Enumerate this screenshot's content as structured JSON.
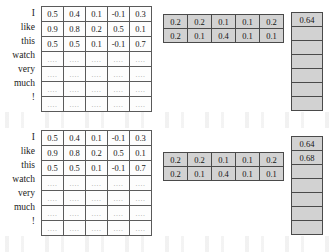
{
  "figure": {
    "colors": {
      "grid_fill": "#d2d2d2",
      "matrix_fill": "#fdfdfd",
      "border_outer": "#3a3a3a",
      "border_inner": "#5a5a5a",
      "text": "#161616",
      "ellipsis": "#9a9a9a",
      "background": "#ffffff"
    },
    "ellipsis_glyph": "...."
  },
  "panels": [
    {
      "id": "panel-top",
      "word_labels": [
        "I",
        "like",
        "this",
        "watch",
        "very",
        "much",
        "!"
      ],
      "embedding_matrix": {
        "rows": 7,
        "cols": 5,
        "values": [
          [
            "0.5",
            "0.4",
            "0.1",
            "-0.1",
            "0.3"
          ],
          [
            "0.9",
            "0.8",
            "0.2",
            "0.5",
            "0.1"
          ],
          [
            "0.5",
            "0.5",
            "0.1",
            "-0.1",
            "0.7"
          ],
          [
            "....",
            "....",
            "....",
            "....",
            "...."
          ],
          [
            "....",
            "....",
            "....",
            "....",
            "...."
          ],
          [
            "....",
            "....",
            "....",
            "....",
            "...."
          ],
          [
            "....",
            "....",
            "....",
            "....",
            "...."
          ]
        ]
      },
      "attention_grid": {
        "rows": 2,
        "cols": 5,
        "row_offset": 0,
        "values": [
          [
            "0.2",
            "0.2",
            "0.1",
            "0.1",
            "0.2"
          ],
          [
            "0.2",
            "0.1",
            "0.4",
            "0.1",
            "0.1"
          ]
        ]
      },
      "output_column": {
        "cells": 7,
        "values": [
          "0.64",
          "",
          "",
          "",
          "",
          "",
          ""
        ]
      }
    },
    {
      "id": "panel-bottom",
      "word_labels": [
        "I",
        "like",
        "this",
        "watch",
        "very",
        "much",
        "!"
      ],
      "embedding_matrix": {
        "rows": 7,
        "cols": 5,
        "values": [
          [
            "0.5",
            "0.4",
            "0.1",
            "-0.1",
            "0.3"
          ],
          [
            "0.9",
            "0.8",
            "0.2",
            "0.5",
            "0.1"
          ],
          [
            "0.5",
            "0.5",
            "0.1",
            "-0.1",
            "0.7"
          ],
          [
            "....",
            "....",
            "....",
            "....",
            "...."
          ],
          [
            "....",
            "....",
            "....",
            "....",
            "...."
          ],
          [
            "....",
            "....",
            "....",
            "....",
            "...."
          ],
          [
            "....",
            "....",
            "....",
            "....",
            "...."
          ]
        ]
      },
      "attention_grid": {
        "rows": 2,
        "cols": 5,
        "row_offset": 1,
        "values": [
          [
            "0.2",
            "0.2",
            "0.1",
            "0.1",
            "0.2"
          ],
          [
            "0.2",
            "0.1",
            "0.4",
            "0.1",
            "0.1"
          ]
        ]
      },
      "output_column": {
        "cells": 7,
        "values": [
          "0.64",
          "0.68",
          "",
          "",
          "",
          "",
          ""
        ]
      }
    }
  ]
}
